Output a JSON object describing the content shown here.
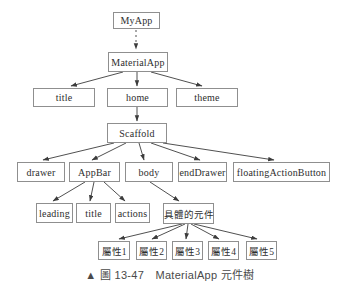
{
  "diagram": {
    "nodes": {
      "myapp": "MyApp",
      "materialapp": "MaterialApp",
      "title_prop": "title",
      "home": "home",
      "theme": "theme",
      "scaffold": "Scaffold",
      "drawer": "drawer",
      "appbar": "AppBar",
      "body": "body",
      "enddrawer": "endDrawer",
      "floating_action_button": "floatingActionButton",
      "leading": "leading",
      "appbar_title": "title",
      "actions": "actions",
      "specific_widget": "具體的元件",
      "attr1": "屬性1",
      "attr2": "屬性2",
      "attr3": "屬性3",
      "attr4": "屬性4",
      "attr5": "屬性5"
    },
    "caption": "▲ 圖 13-47　MaterialApp 元件樹",
    "colors": {
      "line": "#3c3c3c",
      "box_border": "#8f8f8f",
      "text": "#2e2e2e",
      "background": "#ffffff"
    }
  }
}
